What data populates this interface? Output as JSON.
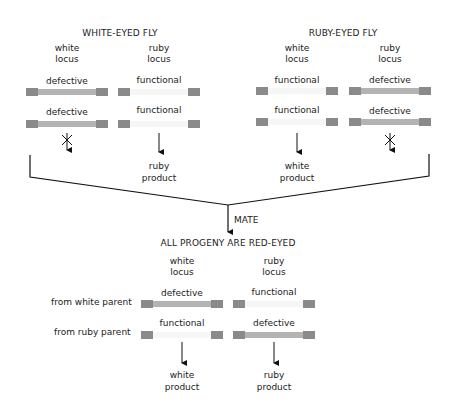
{
  "parents": [
    {
      "title": "WHITE-EYED FLY",
      "loci": [
        {
          "label_line1": "white",
          "label_line2": "locus",
          "alleles": [
            "defective",
            "defective"
          ],
          "product": null,
          "blocked": true
        },
        {
          "label_line1": "ruby",
          "label_line2": "locus",
          "alleles": [
            "functional",
            "functional"
          ],
          "product_line1": "ruby",
          "product_line2": "product",
          "blocked": false
        }
      ]
    },
    {
      "title": "RUBY-EYED FLY",
      "loci": [
        {
          "label_line1": "white",
          "label_line2": "locus",
          "alleles": [
            "functional",
            "functional"
          ],
          "product_line1": "white",
          "product_line2": "product",
          "blocked": false
        },
        {
          "label_line1": "ruby",
          "label_line2": "locus",
          "alleles": [
            "defective",
            "defective"
          ],
          "product": null,
          "blocked": true
        }
      ]
    }
  ],
  "mate_label": "MATE",
  "progeny": {
    "title": "ALL PROGENY ARE RED-EYED",
    "row_labels": [
      "from white parent",
      "from ruby parent"
    ],
    "loci": [
      {
        "label_line1": "white",
        "label_line2": "locus",
        "alleles": [
          "defective",
          "functional"
        ],
        "product_line1": "white",
        "product_line2": "product"
      },
      {
        "label_line1": "ruby",
        "label_line2": "locus",
        "alleles": [
          "functional",
          "defective"
        ],
        "product_line1": "ruby",
        "product_line2": "product"
      }
    ]
  },
  "colors": {
    "bar_end": "#8a8a8a",
    "defective": "#b3b3b3",
    "functional": "#f6f6f6",
    "line": "#111111"
  }
}
